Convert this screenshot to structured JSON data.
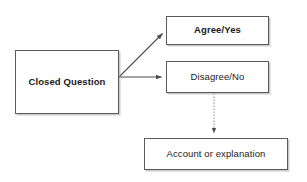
{
  "diagram": {
    "canvas": {
      "width": 307,
      "height": 182,
      "background": "#ffffff"
    },
    "style": {
      "node_fill": "#ffffff",
      "node_border": "#5a5a5a",
      "node_shadow": "#a0a0a0",
      "text_color": "#1a1a1a",
      "edge_color": "#4d4d4d"
    },
    "nodes": [
      {
        "id": "closed-question",
        "label": "Closed Question",
        "shape": "rectangle",
        "x": 15,
        "y": 50,
        "width": 104,
        "height": 64,
        "font_weight": "bold"
      },
      {
        "id": "agree-yes",
        "label": "Agree/Yes",
        "shape": "rectangle",
        "x": 166,
        "y": 16,
        "width": 103,
        "height": 29,
        "font_weight": "bold"
      },
      {
        "id": "disagree-no",
        "label": "Disagree/No",
        "shape": "rectangle",
        "x": 166,
        "y": 61,
        "width": 103,
        "height": 32,
        "font_weight": "normal"
      },
      {
        "id": "account-explanation",
        "label": "Account or explanation",
        "shape": "rectangle",
        "x": 144,
        "y": 138,
        "width": 144,
        "height": 32,
        "font_weight": "normal"
      }
    ],
    "edges": [
      {
        "id": "closed-question-to-agree-yes",
        "from": "closed-question",
        "to": "agree-yes",
        "label": "",
        "line_style": "solid",
        "arrowhead": "filled-triangle",
        "path": "M 119 77 L 163 34"
      },
      {
        "id": "closed-question-to-disagree-no",
        "from": "closed-question",
        "to": "disagree-no",
        "label": "",
        "line_style": "solid",
        "arrowhead": "filled-triangle",
        "path": "M 119 77 L 162 77"
      },
      {
        "id": "disagree-no-to-account-explanation",
        "from": "disagree-no",
        "to": "account-explanation",
        "label": "",
        "line_style": "dotted",
        "arrowhead": "filled-triangle",
        "path": "M 214 93 L 214 133"
      }
    ]
  }
}
